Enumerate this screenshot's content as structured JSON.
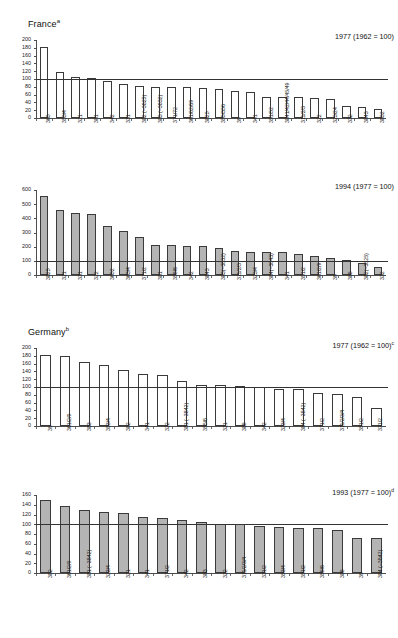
{
  "figure": {
    "sections": [
      {
        "name": "France",
        "footnote_marker": "a"
      },
      {
        "name": "Germany",
        "footnote_marker": "b"
      }
    ]
  },
  "chart_data": [
    {
      "type": "bar",
      "panel_id": "france-1977",
      "title": "1977 (1962 = 100)",
      "title_marker": "",
      "section": "France",
      "xlabel": "",
      "ylabel": "",
      "ylim": [
        0,
        200
      ],
      "ytick_step": 20,
      "yticks": [
        0,
        20,
        40,
        60,
        80,
        100,
        120,
        140,
        160,
        180,
        200
      ],
      "reference_line": 100,
      "grid": false,
      "legend": "none",
      "bar_style": "hollow",
      "categories": [
        "365",
        "353/4",
        "321",
        "381",
        "342",
        "331",
        "382 (−3825)",
        "383 (−3832)",
        "371/72",
        "361/62/69",
        "3825",
        "355/356",
        "39",
        "341",
        "351/52",
        "3841/42/44/45/49",
        "311/2/3",
        "322",
        "323/24",
        "332",
        "3843",
        "3832"
      ],
      "values": [
        183,
        117,
        105,
        103,
        95,
        86,
        82,
        80,
        80,
        80,
        77,
        75,
        68,
        66,
        54,
        54,
        54,
        52,
        48,
        30,
        29,
        23
      ]
    },
    {
      "type": "bar",
      "panel_id": "france-1994",
      "title": "1994 (1977 = 100)",
      "title_marker": "",
      "section": "France",
      "xlabel": "",
      "ylabel": "",
      "ylim": [
        0,
        600
      ],
      "ytick_step": 100,
      "yticks": [
        0,
        100,
        200,
        300,
        400,
        500,
        600
      ],
      "reference_line": 100,
      "grid": false,
      "legend": "none",
      "bar_style": "filled",
      "categories": [
        "3825",
        "321",
        "331",
        "322",
        "3652",
        "363/4",
        "371/2",
        "381",
        "355/6",
        "342",
        "3843",
        "383(−3832)",
        "311/2/3",
        "323/4",
        "384(−3843)",
        "341",
        "351/2",
        "361/2/9",
        "39",
        "385",
        "382(−3825)",
        "332"
      ],
      "values": [
        556,
        462,
        440,
        430,
        345,
        313,
        268,
        215,
        210,
        207,
        202,
        188,
        168,
        165,
        165,
        162,
        146,
        137,
        117,
        105,
        88,
        57
      ]
    },
    {
      "type": "bar",
      "panel_id": "germany-1977",
      "title": "1977 (1962 = 100)",
      "title_marker": "c",
      "section": "Germany",
      "xlabel": "",
      "ylabel": "",
      "ylim": [
        0,
        200
      ],
      "ytick_step": 20,
      "yticks": [
        0,
        20,
        40,
        60,
        80,
        100,
        120,
        140,
        160,
        180,
        200
      ],
      "reference_line": 100,
      "grid": false,
      "legend": "none",
      "bar_style": "hollow",
      "categories": [
        "39",
        "361/2/9",
        "383",
        "353/4",
        "382",
        "341",
        "322",
        "381 (−3842)",
        "355/6",
        "321",
        "385",
        "342",
        "323/4",
        "384 (−3842)",
        "371/2",
        "311/2/3/4",
        "351/2",
        "331/2"
      ],
      "values": [
        182,
        180,
        163,
        157,
        143,
        133,
        130,
        116,
        106,
        106,
        103,
        101,
        94,
        94,
        85,
        81,
        75,
        47
      ]
    },
    {
      "type": "bar",
      "panel_id": "germany-1993",
      "title": "1993 (1977 = 100)",
      "title_marker": "d",
      "section": "Germany",
      "xlabel": "",
      "ylabel": "",
      "ylim": [
        0,
        160
      ],
      "ytick_step": 20,
      "yticks": [
        0,
        20,
        40,
        60,
        80,
        100,
        120,
        140,
        160
      ],
      "reference_line": 100,
      "grid": false,
      "legend": "none",
      "bar_style": "filled",
      "categories": [
        "382",
        "361/2/9",
        "381 (−3842)",
        "323/4",
        "321",
        "341",
        "371/2",
        "342",
        "383",
        "322",
        "311/2/3/4",
        "331/2",
        "353/4",
        "351/2",
        "355/6",
        "385",
        "39",
        "384 (−3842)"
      ],
      "values": [
        150,
        138,
        129,
        125,
        123,
        115,
        113,
        108,
        105,
        101,
        100,
        97,
        95,
        93,
        92,
        89,
        72,
        71
      ]
    }
  ]
}
